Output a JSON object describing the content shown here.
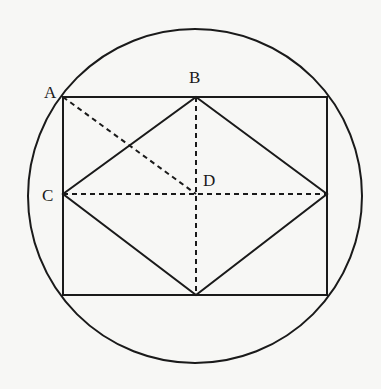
{
  "diagram": {
    "type": "geometry",
    "colors": {
      "stroke": "#1a1a1a",
      "background": "#f7f7f5"
    },
    "circle": {
      "cx": 195,
      "cy": 196,
      "r": 167
    },
    "rectangle": {
      "x1": 63,
      "y1": 97,
      "x2": 327,
      "y2": 295
    },
    "points": {
      "A": {
        "label": "A",
        "x": 63,
        "y": 97
      },
      "B": {
        "label": "B",
        "x": 196,
        "y": 97
      },
      "C": {
        "label": "C",
        "x": 63,
        "y": 194
      },
      "D": {
        "label": "D",
        "x": 196,
        "y": 194
      }
    },
    "solid_segments": [
      "rectangle sides",
      "rhombus B-right-bottom-C"
    ],
    "dashed_segments": [
      "A-D",
      "C-right midpoint",
      "B-bottom midpoint"
    ]
  }
}
